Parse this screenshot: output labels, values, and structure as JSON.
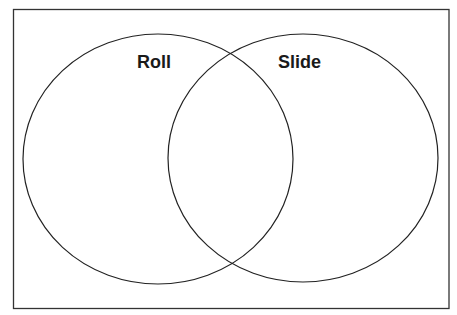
{
  "diagram": {
    "type": "venn",
    "sets": [
      {
        "id": "left",
        "label": "Roll"
      },
      {
        "id": "right",
        "label": "Slide"
      }
    ],
    "colors": {
      "stroke": "#222222",
      "frame": "#333333",
      "background": "#ffffff"
    }
  }
}
